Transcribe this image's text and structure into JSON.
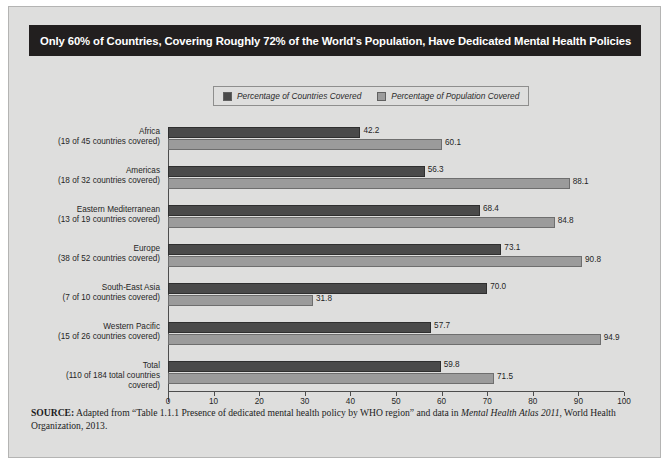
{
  "figure": {
    "title": "Only 60% of Countries, Covering Roughly 72% of the World's Population, Have Dedicated Mental Health Policies",
    "title_bg": "#221f1f",
    "panel_bg": "#dededd"
  },
  "legend": {
    "items": [
      {
        "label": "Percentage of Countries Covered",
        "color": "#4a4a4a"
      },
      {
        "label": "Percentage of Population Covered",
        "color": "#9b9b9b"
      }
    ]
  },
  "source": {
    "prefix": "SOURCE:",
    "text_part1": " Adapted from “Table 1.1.1 Presence of dedicated mental health policy by WHO region” and data in ",
    "italic": "Mental Health Atlas 2011",
    "text_part2": ", World Health Organization, 2013."
  },
  "chart_data": {
    "type": "bar",
    "orientation": "horizontal",
    "title": "Only 60% of Countries, Covering Roughly 72% of the World's Population, Have Dedicated Mental Health Policies",
    "xlabel": "",
    "ylabel": "",
    "xlim": [
      0,
      100
    ],
    "xticks": [
      0,
      10,
      20,
      30,
      40,
      50,
      60,
      70,
      80,
      90,
      100
    ],
    "grid": false,
    "legend_position": "top-center",
    "categories": [
      "Africa",
      "Americas",
      "Eastern Mediterranean",
      "Europe",
      "South-East Asia",
      "Western Pacific",
      "Total"
    ],
    "category_sublabels": [
      "(19 of 45 countries covered)",
      "(18 of 32 countries covered)",
      "(13 of 19 countries covered)",
      "(38 of 52 countries covered)",
      "(7 of 10 countries covered)",
      "(15 of 26 countries covered)",
      "(110 of 184 total countries covered)"
    ],
    "series": [
      {
        "name": "Percentage of Countries Covered",
        "color": "#4a4a4a",
        "values": [
          42.2,
          56.3,
          68.4,
          73.1,
          70.0,
          57.7,
          59.8
        ]
      },
      {
        "name": "Percentage of Population Covered",
        "color": "#9b9b9b",
        "values": [
          60.1,
          88.1,
          84.8,
          90.8,
          31.8,
          94.9,
          71.5
        ]
      }
    ]
  }
}
